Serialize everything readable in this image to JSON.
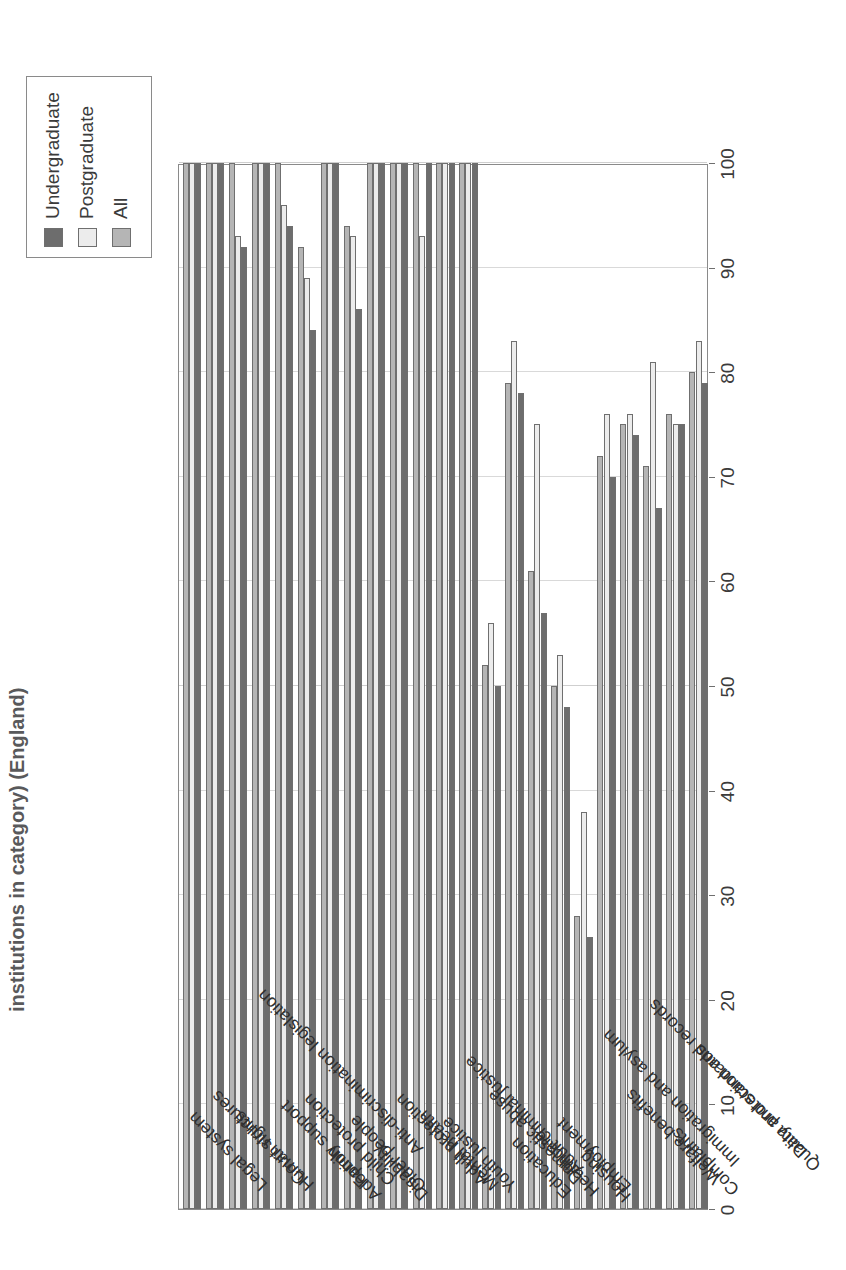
{
  "chart_data": {
    "type": "bar",
    "orientation": "horizontal",
    "title": "institutions in category) (England)",
    "xlabel": "",
    "ylabel": "",
    "xlim": [
      0,
      100
    ],
    "xticks": [
      0,
      10,
      20,
      30,
      40,
      50,
      60,
      70,
      80,
      90,
      100
    ],
    "grid": true,
    "legend_position": "top-right",
    "categories": [
      "Legal system",
      "Court structures",
      "Human rights",
      "Anti-discrimination legislation",
      "Family support",
      "Child protection",
      "Adoption",
      "Older people",
      "Disability",
      "Adult protection",
      "Mental health",
      "Youth justice",
      "Adult criminal justice",
      "Domestic abuse",
      "Education",
      "Healthcare",
      "Employment",
      "Housing",
      "Immigration and asylum",
      "Welfare benefits",
      "Data protection and records",
      "Complaints",
      "Quality and standards"
    ],
    "series": [
      {
        "name": "Undergraduate",
        "color": "#6d6d6d",
        "values": [
          100,
          100,
          92,
          100,
          94,
          84,
          100,
          86,
          100,
          100,
          100,
          100,
          100,
          50,
          78,
          57,
          48,
          26,
          70,
          74,
          67,
          75,
          79
        ]
      },
      {
        "name": "Postgraduate",
        "color": "#ececec",
        "values": [
          100,
          100,
          93,
          100,
          96,
          89,
          100,
          93,
          100,
          100,
          93,
          100,
          100,
          56,
          83,
          75,
          53,
          38,
          76,
          76,
          81,
          75,
          83
        ]
      },
      {
        "name": "All",
        "color": "#b5b5b5",
        "values": [
          100,
          100,
          100,
          100,
          100,
          92,
          100,
          94,
          100,
          100,
          100,
          100,
          100,
          52,
          79,
          61,
          50,
          28,
          72,
          75,
          71,
          76,
          80
        ]
      }
    ]
  },
  "legend": {
    "items": [
      {
        "label": "Undergraduate",
        "color": "#6d6d6d"
      },
      {
        "label": "Postgraduate",
        "color": "#ececec"
      },
      {
        "label": "All",
        "color": "#b5b5b5"
      }
    ]
  },
  "axis": {
    "tick_labels": [
      "0",
      "10",
      "20",
      "30",
      "40",
      "50",
      "60",
      "70",
      "80",
      "90",
      "100"
    ]
  }
}
